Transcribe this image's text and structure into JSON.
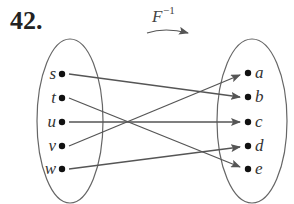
{
  "problem": {
    "number": "42."
  },
  "function": {
    "name": "F",
    "superscript": "−1"
  },
  "domain_set": {
    "elements": [
      "s",
      "t",
      "u",
      "v",
      "w"
    ]
  },
  "codomain_set": {
    "elements": [
      "a",
      "b",
      "c",
      "d",
      "e"
    ]
  },
  "mappings": [
    {
      "from": "s",
      "to": "b"
    },
    {
      "from": "t",
      "to": "e"
    },
    {
      "from": "u",
      "to": "c"
    },
    {
      "from": "v",
      "to": "a"
    },
    {
      "from": "w",
      "to": "d"
    }
  ],
  "colors": {
    "ellipse": "#666666",
    "arrow": "#555555",
    "dot": "#111111",
    "text": "#333333"
  }
}
